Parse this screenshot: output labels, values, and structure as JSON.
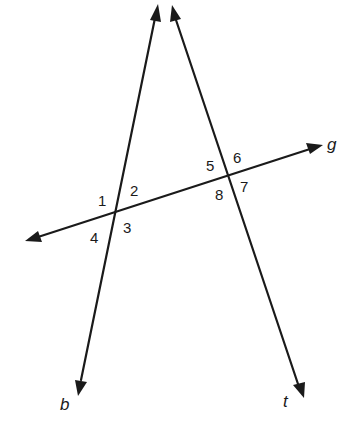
{
  "diagram": {
    "type": "transversal-angles",
    "background": "#ffffff",
    "stroke_color": "#1a1a1a",
    "lines": [
      {
        "name": "b",
        "label": "b",
        "start": [
          78,
          395
        ],
        "end": [
          158,
          4
        ],
        "arrows": "both"
      },
      {
        "name": "t",
        "label": "t",
        "start": [
          303,
          397
        ],
        "end": [
          172,
          6
        ],
        "arrows": "both"
      },
      {
        "name": "g",
        "label": "g",
        "start": [
          26,
          241
        ],
        "end": [
          322,
          145
        ],
        "arrows": "both"
      }
    ],
    "intersections": [
      {
        "lines": [
          "b",
          "g"
        ],
        "point": [
          118,
          210
        ],
        "angles": [
          "1",
          "2",
          "3",
          "4"
        ]
      },
      {
        "lines": [
          "t",
          "g"
        ],
        "point": [
          230,
          174
        ],
        "angles": [
          "5",
          "6",
          "7",
          "8"
        ]
      }
    ],
    "angle_labels": {
      "a1": "1",
      "a2": "2",
      "a3": "3",
      "a4": "4",
      "a5": "5",
      "a6": "6",
      "a7": "7",
      "a8": "8"
    },
    "line_labels": {
      "b": "b",
      "t": "t",
      "g": "g"
    }
  }
}
